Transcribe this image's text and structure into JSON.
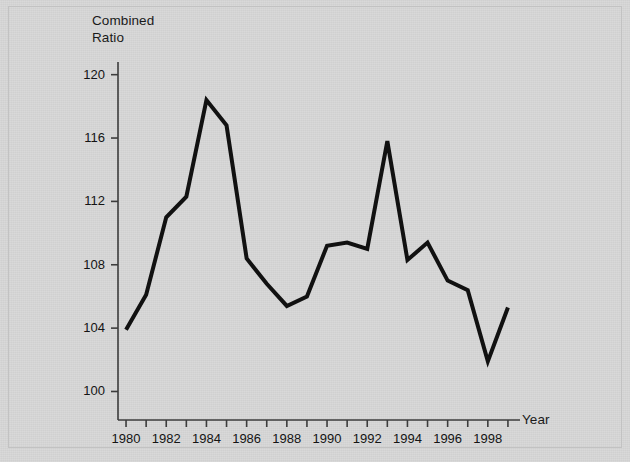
{
  "chart_data": {
    "type": "line",
    "title": "",
    "xlabel": "Year",
    "ylabel": "Combined Ratio",
    "ylabel_lines": [
      "Combined",
      "Ratio"
    ],
    "x": [
      1980,
      1981,
      1982,
      1983,
      1984,
      1985,
      1986,
      1987,
      1988,
      1989,
      1990,
      1991,
      1992,
      1993,
      1994,
      1995,
      1996,
      1997,
      1998,
      1999
    ],
    "values": [
      103.9,
      106.1,
      111.0,
      112.3,
      118.4,
      116.8,
      108.4,
      106.8,
      105.4,
      106.0,
      109.2,
      109.4,
      109.0,
      115.8,
      108.3,
      109.4,
      107.0,
      106.4,
      101.9,
      105.3
    ],
    "series": [
      {
        "name": "Combined Ratio",
        "values": [
          103.9,
          106.1,
          111.0,
          112.3,
          118.4,
          116.8,
          108.4,
          106.8,
          105.4,
          106.0,
          109.2,
          109.4,
          109.0,
          115.8,
          108.3,
          109.4,
          107.0,
          106.4,
          101.9,
          105.3
        ]
      }
    ],
    "xlim": [
      1979.6,
      1999.6
    ],
    "ylim": [
      98.2,
      120.8
    ],
    "yticks": [
      100,
      104,
      108,
      112,
      116,
      120
    ],
    "ytick_labels": [
      "100",
      "104",
      "108",
      "112",
      "116",
      "120"
    ],
    "xticks": [
      1980,
      1981,
      1982,
      1983,
      1984,
      1985,
      1986,
      1987,
      1988,
      1989,
      1990,
      1991,
      1992,
      1993,
      1994,
      1995,
      1996,
      1997,
      1998,
      1999
    ],
    "xtick_labels_shown": [
      "1980",
      "1982",
      "1984",
      "1986",
      "1988",
      "1990",
      "1992",
      "1994",
      "1996",
      "1998"
    ],
    "xtick_labels_values": [
      1980,
      1982,
      1984,
      1986,
      1988,
      1990,
      1992,
      1994,
      1996,
      1998
    ],
    "grid": false,
    "legend": "none",
    "line_color": "#111111",
    "line_width": 4,
    "background_color": "#d7d7d7",
    "axis_color": "#3c3c3c"
  }
}
